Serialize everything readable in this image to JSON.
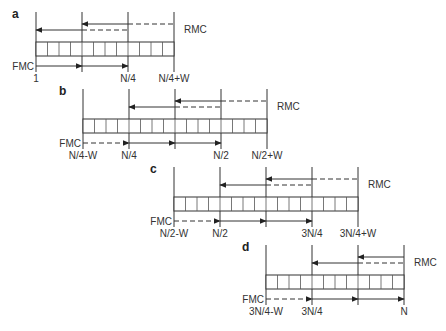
{
  "diagram": {
    "legend": {
      "forward_label": "FMC",
      "reverse_label": "RMC"
    },
    "panels": [
      {
        "id": "a",
        "label": "a",
        "boundaries": [
          "1",
          "",
          "N/4",
          "N/4+W"
        ],
        "cells_per_section": 4,
        "fmc": [
          {
            "from": 0,
            "to": 1,
            "style": "solid"
          },
          {
            "from": 1,
            "to": 2,
            "style": "solid"
          }
        ],
        "rmc_upper": [
          {
            "from": 2,
            "to": 1,
            "style": "solid"
          },
          {
            "from": 2,
            "to": 3,
            "style": "dashed"
          }
        ],
        "rmc_lower": [
          {
            "from": 1,
            "to": 0,
            "style": "solid"
          },
          {
            "from": 1,
            "to": 2,
            "style": "dashed"
          }
        ]
      },
      {
        "id": "b",
        "label": "b",
        "boundaries": [
          "N/4-W",
          "N/4",
          "",
          "N/2",
          "N/2+W"
        ],
        "cells_per_section": 4,
        "fmc": [
          {
            "from": 0,
            "to": 1,
            "style": "dashed"
          },
          {
            "from": 1,
            "to": 2,
            "style": "solid"
          },
          {
            "from": 2,
            "to": 3,
            "style": "solid"
          }
        ],
        "rmc_upper": [
          {
            "from": 3,
            "to": 2,
            "style": "solid"
          },
          {
            "from": 3,
            "to": 4,
            "style": "dashed"
          }
        ],
        "rmc_lower": [
          {
            "from": 2,
            "to": 1,
            "style": "solid"
          },
          {
            "from": 2,
            "to": 3,
            "style": "dashed"
          }
        ]
      },
      {
        "id": "c",
        "label": "c",
        "boundaries": [
          "N/2-W",
          "N/2",
          "",
          "3N/4",
          "3N/4+W"
        ],
        "cells_per_section": 4,
        "fmc": [
          {
            "from": 0,
            "to": 1,
            "style": "dashed"
          },
          {
            "from": 1,
            "to": 2,
            "style": "solid"
          },
          {
            "from": 2,
            "to": 3,
            "style": "solid"
          }
        ],
        "rmc_upper": [
          {
            "from": 3,
            "to": 2,
            "style": "solid"
          },
          {
            "from": 3,
            "to": 4,
            "style": "dashed"
          }
        ],
        "rmc_lower": [
          {
            "from": 2,
            "to": 1,
            "style": "solid"
          },
          {
            "from": 2,
            "to": 3,
            "style": "dashed"
          }
        ]
      },
      {
        "id": "d",
        "label": "d",
        "boundaries": [
          "3N/4-W",
          "3N/4",
          "",
          "N"
        ],
        "cells_per_section": 4,
        "fmc": [
          {
            "from": 0,
            "to": 1,
            "style": "dashed"
          },
          {
            "from": 1,
            "to": 2,
            "style": "solid"
          },
          {
            "from": 2,
            "to": 3,
            "style": "solid"
          }
        ],
        "rmc_upper": [
          {
            "from": 3,
            "to": 2,
            "style": "solid"
          }
        ],
        "rmc_lower": [
          {
            "from": 2,
            "to": 1,
            "style": "solid"
          },
          {
            "from": 2,
            "to": 3,
            "style": "dashed"
          }
        ]
      }
    ]
  }
}
